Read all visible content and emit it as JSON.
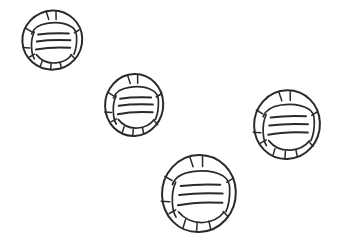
{
  "figure": {
    "medium": "pencil-like monochrome line drawing",
    "canvas": {
      "width": 340,
      "height": 250
    },
    "background_color": "#ffffff",
    "ink_color": "#2a2a2c",
    "object_count": 4
  },
  "objects": [
    {
      "id": "object-1",
      "label": "top-left round object",
      "center_x": 52,
      "center_y": 40,
      "radius_x": 30,
      "radius_y": 30,
      "rule_count": 3,
      "tick_count": 10,
      "size": "small"
    },
    {
      "id": "object-2",
      "label": "upper-middle round object",
      "center_x": 134,
      "center_y": 105,
      "radius_x": 29,
      "radius_y": 31,
      "rule_count": 3,
      "tick_count": 10,
      "size": "small"
    },
    {
      "id": "object-3",
      "label": "right round object",
      "center_x": 287,
      "center_y": 124,
      "radius_x": 33,
      "radius_y": 34,
      "rule_count": 3,
      "tick_count": 10,
      "size": "medium"
    },
    {
      "id": "object-4",
      "label": "bottom-middle round object",
      "center_x": 199,
      "center_y": 193,
      "radius_x": 36,
      "radius_y": 38,
      "rule_count": 3,
      "tick_count": 10,
      "size": "large"
    }
  ]
}
